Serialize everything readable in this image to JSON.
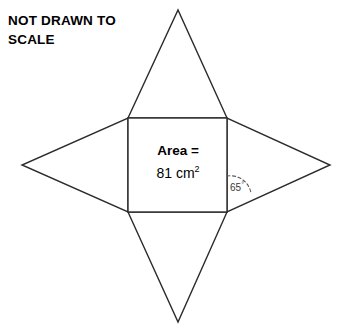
{
  "note": {
    "line1": "NOT DRAWN TO",
    "line2": "SCALE"
  },
  "figure": {
    "area_title": "Area =",
    "area_value": "81 cm",
    "area_value_exponent": "2",
    "angle_value": "65",
    "angle_unit": "°",
    "stroke_color": "#2b2b2b",
    "fill_color": "#ffffff",
    "dash_color": "#5a5a5a"
  },
  "geometry": {
    "square": {
      "left": 128,
      "top": 118,
      "right": 227,
      "bottom": 212
    },
    "apex_top": {
      "x": 178,
      "y": 10
    },
    "apex_bottom": {
      "x": 178,
      "y": 322
    },
    "apex_left": {
      "x": 22,
      "y": 165
    },
    "apex_right": {
      "x": 330,
      "y": 165
    }
  }
}
